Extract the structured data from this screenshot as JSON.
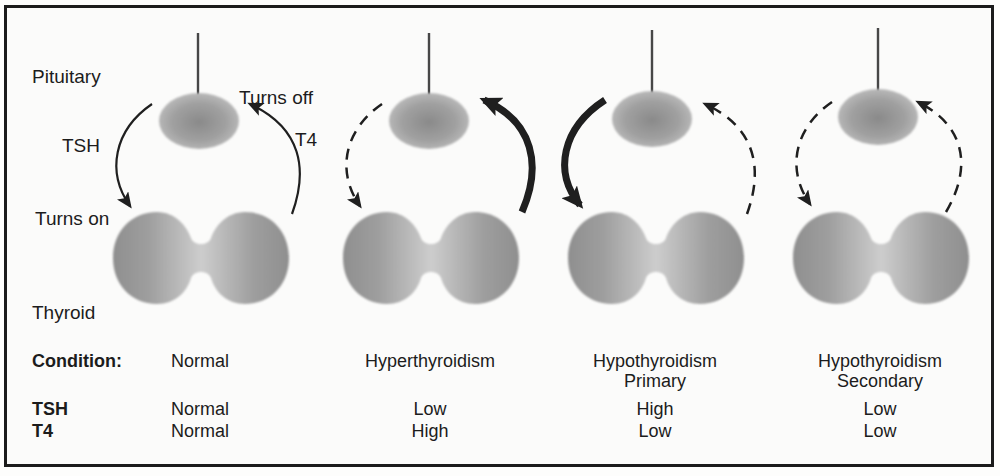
{
  "diagram": {
    "labels": {
      "pituitary": "Pituitary",
      "turns_off": "Turns off",
      "tsh": "TSH",
      "t4": "T4",
      "turns_on": "Turns on",
      "thyroid": "Thyroid"
    },
    "row_headers": {
      "condition": "Condition:",
      "tsh": "TSH",
      "t4": "T4"
    },
    "panels": [
      {
        "condition_line1": "Normal",
        "condition_line2": "",
        "tsh_level": "Normal",
        "t4_level": "Normal",
        "tsh_arrow_style": "solid-thin",
        "t4_arrow_style": "solid-thin"
      },
      {
        "condition_line1": "Hyperthyroidism",
        "condition_line2": "",
        "tsh_level": "Low",
        "t4_level": "High",
        "tsh_arrow_style": "dashed-thin",
        "t4_arrow_style": "solid-thick"
      },
      {
        "condition_line1": "Hypothyroidism",
        "condition_line2": "Primary",
        "tsh_level": "High",
        "t4_level": "Low",
        "tsh_arrow_style": "solid-thick",
        "t4_arrow_style": "dashed-thin"
      },
      {
        "condition_line1": "Hypothyroidism",
        "condition_line2": "Secondary",
        "tsh_level": "Low",
        "t4_level": "Low",
        "tsh_arrow_style": "dashed-thin",
        "t4_arrow_style": "dashed-thin"
      }
    ],
    "colors": {
      "border": "#1b1b1b",
      "text": "#1c1c1c",
      "arrow": "#1f1f1f",
      "gland_dark": "#8d8d8d",
      "gland_light": "#cdcdcd",
      "background": "#fbfbfa"
    }
  }
}
